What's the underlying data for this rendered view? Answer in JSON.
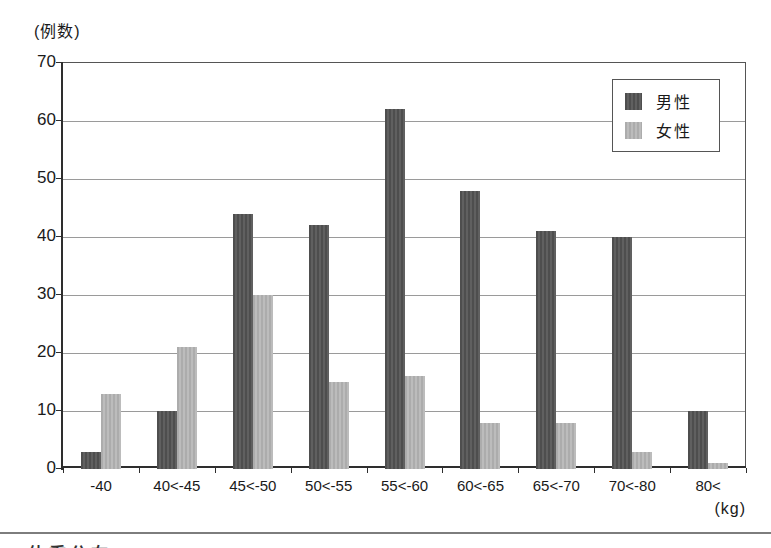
{
  "chart_data": {
    "type": "bar",
    "title": "",
    "y_axis_unit": "(例数)",
    "x_axis_unit": "(kg)",
    "categories": [
      "-40",
      "40<-45",
      "45<-50",
      "50<-55",
      "55<-60",
      "60<-65",
      "65<-70",
      "70<-80",
      "80<"
    ],
    "series": [
      {
        "name": "男性",
        "values": [
          3,
          10,
          44,
          42,
          62,
          48,
          41,
          40,
          10
        ],
        "color": "#575757"
      },
      {
        "name": "女性",
        "values": [
          13,
          21,
          30,
          15,
          16,
          8,
          8,
          3,
          1
        ],
        "color": "#b5b5b5"
      }
    ],
    "ylim": [
      0,
      70
    ],
    "y_ticks": [
      0,
      10,
      20,
      30,
      40,
      50,
      60,
      70
    ],
    "grid": "horizontal",
    "legend_position": "top-right"
  },
  "legend": {
    "items": [
      {
        "label": "男性",
        "color": "#575757"
      },
      {
        "label": "女性",
        "color": "#b5b5b5"
      }
    ]
  },
  "footer": {
    "caption_fragment": "体重分布"
  },
  "colors": {
    "male_bar": "#575757",
    "female_bar": "#b5b5b5",
    "gridline": "#9a9a9a",
    "axis": "#2e2e2e",
    "background": "#ffffff"
  }
}
